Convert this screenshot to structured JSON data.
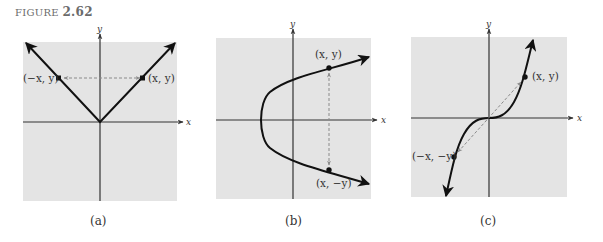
{
  "figure": {
    "prefix": "FIGURE",
    "number": "2.62"
  },
  "panels": [
    {
      "caption": "(a)",
      "x_axis_label": "x",
      "y_axis_label": "y",
      "curve": "y = |x| (V shape, symmetric about y-axis)",
      "points": [
        {
          "label": "(−x, y)"
        },
        {
          "label": "(x, y)"
        }
      ]
    },
    {
      "caption": "(b)",
      "x_axis_label": "x",
      "y_axis_label": "y",
      "curve": "sideways parabola opening right (symmetric about x-axis)",
      "points": [
        {
          "label": "(x, y)"
        },
        {
          "label": "(x, −y)"
        }
      ]
    },
    {
      "caption": "(c)",
      "x_axis_label": "x",
      "y_axis_label": "y",
      "curve": "cubic y = x^3 (symmetric about origin)",
      "points": [
        {
          "label": "(x, y)"
        },
        {
          "label": "(−x, −y)"
        }
      ]
    }
  ],
  "colors": {
    "panel_bg": "#e4e4e4",
    "curve": "#111111",
    "axis": "#333333",
    "dashed": "#8a8a8a"
  }
}
